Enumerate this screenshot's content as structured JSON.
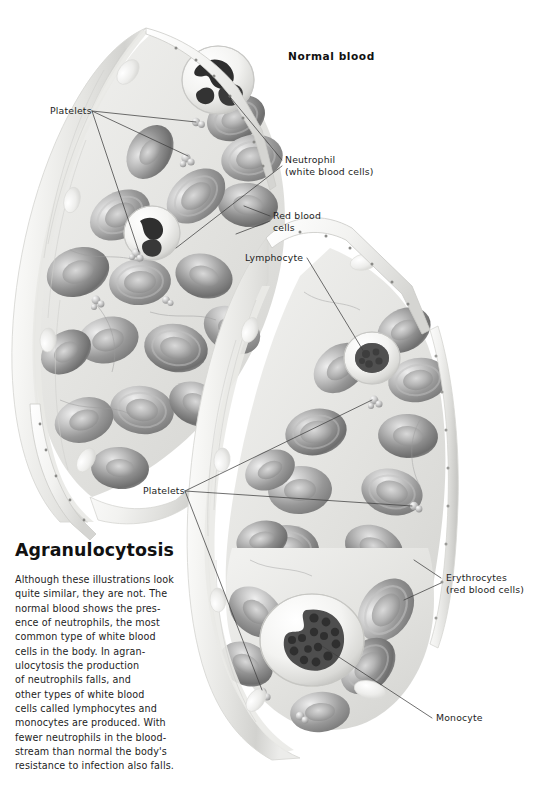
{
  "page": {
    "background_color": "#ffffff",
    "text_color": "#1d1d1d",
    "width": 535,
    "height": 788
  },
  "illustration": {
    "kind": "medical-illustration",
    "subject": "blood vessel cross sections comparing normal blood and agranulocytosis",
    "palette": {
      "vessel_wall_light": "#f7f7f5",
      "vessel_wall_mid": "#e3e3e0",
      "vessel_wall_shadow": "#c9c9c6",
      "lumen_background": "#ebebe8",
      "erythrocyte_mid": "#9a9a9a",
      "erythrocyte_dark": "#6f6f6f",
      "erythrocyte_light": "#d6d6d6",
      "nucleus_dark": "#3a3a3a",
      "leader_line": "#4a4a4a",
      "platelet": "#b9b9b9"
    }
  },
  "titles": {
    "normal_blood": "Normal blood",
    "agranulocytosis": "Agranulocytosis"
  },
  "labels": {
    "platelets_top": {
      "line1": "Platelets",
      "line2": ""
    },
    "neutrophil": {
      "line1": "Neutrophil",
      "line2": "(white blood cells)"
    },
    "red_blood_cells": {
      "line1": "Red blood",
      "line2": "cells"
    },
    "lymphocyte": {
      "line1": "Lymphocyte",
      "line2": ""
    },
    "platelets_bottom": {
      "line1": "Platelets",
      "line2": ""
    },
    "erythrocytes": {
      "line1": "Erythrocytes",
      "line2": "(red blood cells)"
    },
    "monocyte": {
      "line1": "Monocyte",
      "line2": ""
    }
  },
  "body_text": {
    "lines": [
      "Although these illustrations look",
      "quite similar, they are not. The",
      "normal blood shows the pres-",
      "ence of neutrophils, the most",
      "common type of white blood",
      "cells in the body. In agran-",
      "ulocytosis the production",
      "of neutrophils falls, and",
      "other types of white blood",
      "cells called lymphocytes and",
      "monocytes are produced. With",
      "fewer neutrophils in the blood-",
      "stream than normal the body's",
      "resistance to infection also falls."
    ]
  }
}
